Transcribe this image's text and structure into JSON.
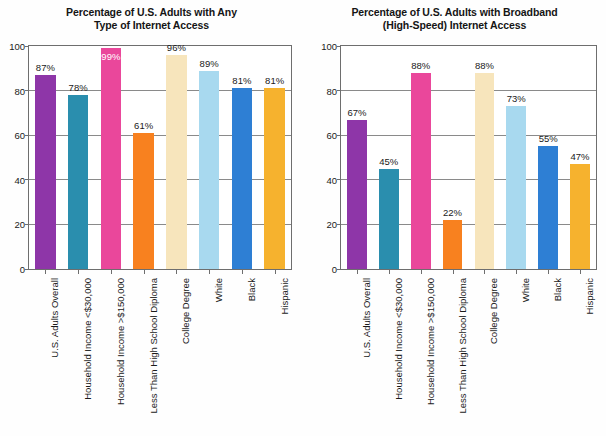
{
  "charts": [
    {
      "title_line1": "Percentage of U.S. Adults with Any",
      "title_line2": "Type of Internet Access",
      "ylim": [
        0,
        100
      ],
      "yticks": [
        "0",
        "20",
        "40",
        "60",
        "80",
        "100"
      ],
      "categories": [
        "U.S. Adults Overall",
        "Household Income <$30,000",
        "Household Income >$150,000",
        "Less Than High School Diploma",
        "College Degree",
        "White",
        "Black",
        "Hispanic"
      ],
      "values": [
        87,
        78,
        99,
        61,
        96,
        89,
        81,
        81
      ],
      "value_labels": [
        "87%",
        "78%",
        "99%",
        "61%",
        "96%",
        "89%",
        "81%",
        "81%"
      ],
      "label_positions": [
        "above",
        "above",
        "inside",
        "above",
        "above",
        "above",
        "above",
        "above"
      ],
      "colors": [
        "#8E36A8",
        "#2A8EAE",
        "#EA479B",
        "#F8811F",
        "#F7E5BC",
        "#A8D9EF",
        "#2E7FD4",
        "#F6B22E"
      ]
    },
    {
      "title_line1": "Percentage of U.S. Adults with Broadband",
      "title_line2": "(High-Speed) Internet Access",
      "ylim": [
        0,
        100
      ],
      "yticks": [
        "0",
        "20",
        "40",
        "60",
        "80",
        "100"
      ],
      "categories": [
        "U.S. Adults Overall",
        "Household Income <$30,000",
        "Household Income >$150,000",
        "Less Than High School Diploma",
        "College Degree",
        "White",
        "Black",
        "Hispanic"
      ],
      "values": [
        67,
        45,
        88,
        22,
        88,
        73,
        55,
        47
      ],
      "value_labels": [
        "67%",
        "45%",
        "88%",
        "22%",
        "88%",
        "73%",
        "55%",
        "47%"
      ],
      "label_positions": [
        "above",
        "above",
        "above",
        "above",
        "above",
        "above",
        "above",
        "above"
      ],
      "colors": [
        "#8E36A8",
        "#2A8EAE",
        "#EA479B",
        "#F8811F",
        "#F7E5BC",
        "#A8D9EF",
        "#2E7FD4",
        "#F6B22E"
      ]
    }
  ],
  "chart_data": [
    {
      "type": "bar",
      "title": "Percentage of U.S. Adults with Any Type of Internet Access",
      "xlabel": "",
      "ylabel": "",
      "ylim": [
        0,
        100
      ],
      "yticks": [
        0,
        20,
        40,
        60,
        80,
        100
      ],
      "grid": true,
      "legend": "none",
      "categories": [
        "U.S. Adults Overall",
        "Household Income <$30,000",
        "Household Income >$150,000",
        "Less Than High School Diploma",
        "College Degree",
        "White",
        "Black",
        "Hispanic"
      ],
      "values": [
        87,
        78,
        99,
        61,
        96,
        89,
        81,
        81
      ],
      "data_labels": [
        "87%",
        "78%",
        "99%",
        "61%",
        "96%",
        "89%",
        "81%",
        "81%"
      ]
    },
    {
      "type": "bar",
      "title": "Percentage of U.S. Adults with Broadband (High-Speed) Internet Access",
      "xlabel": "",
      "ylabel": "",
      "ylim": [
        0,
        100
      ],
      "yticks": [
        0,
        20,
        40,
        60,
        80,
        100
      ],
      "grid": true,
      "legend": "none",
      "categories": [
        "U.S. Adults Overall",
        "Household Income <$30,000",
        "Household Income >$150,000",
        "Less Than High School Diploma",
        "College Degree",
        "White",
        "Black",
        "Hispanic"
      ],
      "values": [
        67,
        45,
        88,
        22,
        88,
        73,
        55,
        47
      ],
      "data_labels": [
        "67%",
        "45%",
        "88%",
        "22%",
        "88%",
        "73%",
        "55%",
        "47%"
      ]
    }
  ]
}
